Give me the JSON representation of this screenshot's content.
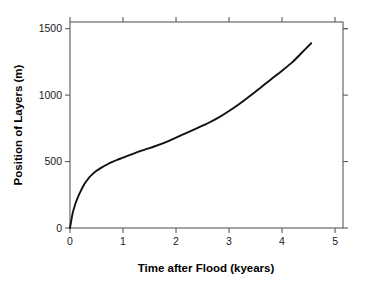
{
  "chart_data": {
    "type": "line",
    "title": "",
    "xlabel": "Time after Flood (kyears)",
    "ylabel": "Position of Layers (m)",
    "xlim": [
      0,
      5.15
    ],
    "ylim": [
      0,
      1550
    ],
    "grid": false,
    "legend": null,
    "xticks": [
      0,
      1,
      2,
      3,
      4,
      5
    ],
    "xtick_labels": [
      "0",
      "1",
      "2",
      "3",
      "4",
      "5"
    ],
    "yticks": [
      0,
      500,
      1000,
      1500
    ],
    "ytick_labels": [
      "0",
      "500",
      "1000",
      "1500"
    ],
    "series": [
      {
        "name": "Position of Layers",
        "color": "#111111",
        "x": [
          0.0,
          0.05,
          0.1,
          0.15,
          0.2,
          0.25,
          0.3,
          0.35,
          0.4,
          0.5,
          0.6,
          0.7,
          0.8,
          0.9,
          1.0,
          1.2,
          1.4,
          1.6,
          1.8,
          2.0,
          2.2,
          2.4,
          2.6,
          2.8,
          3.0,
          3.2,
          3.4,
          3.6,
          3.8,
          4.0,
          4.2,
          4.4,
          4.55
        ],
        "y": [
          0,
          110,
          180,
          232,
          276,
          316,
          348,
          374,
          396,
          430,
          456,
          478,
          497,
          514,
          529,
          560,
          588,
          615,
          645,
          680,
          716,
          752,
          788,
          830,
          880,
          935,
          995,
          1058,
          1122,
          1184,
          1250,
          1330,
          1390
        ]
      }
    ],
    "axes_style": {
      "frame": "full-box",
      "tick_direction": "out",
      "frame_color": "#5a5a5a",
      "curve_color": "#111111",
      "background": "#ffffff"
    },
    "annotations": []
  },
  "geometry": {
    "plot_left": 70,
    "plot_right": 343,
    "plot_top": 22,
    "plot_bottom": 228
  }
}
